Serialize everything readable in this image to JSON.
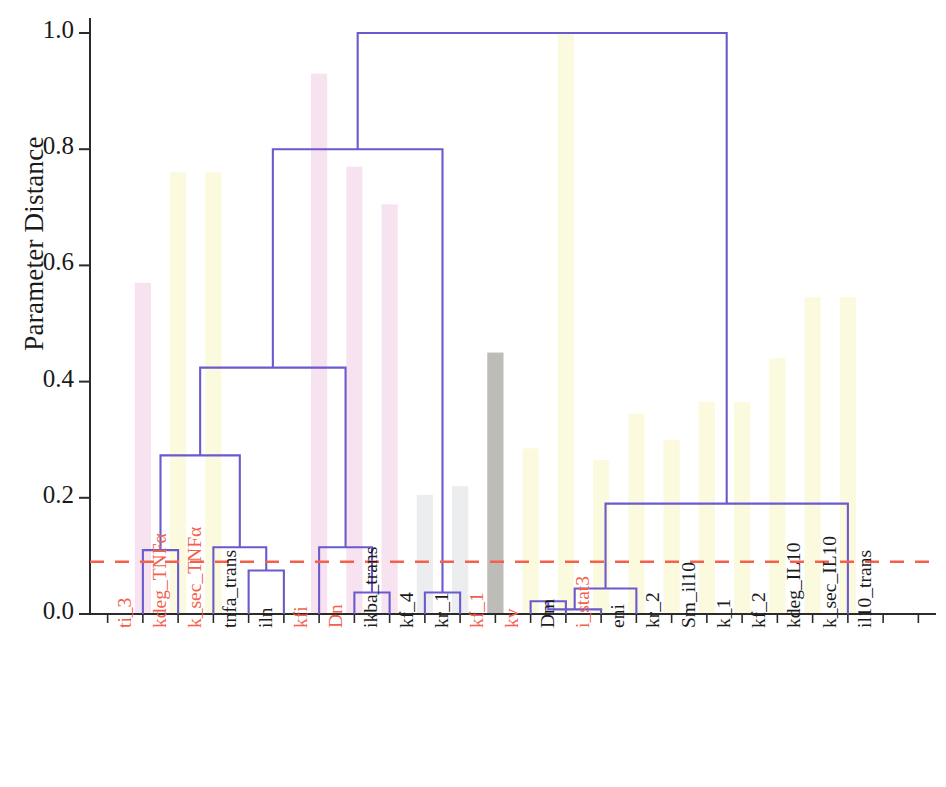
{
  "figure": {
    "type": "dendrogram",
    "ylabel": "Parameter Distance",
    "y_ticks": [
      "1.0",
      "0.8",
      "0.6",
      "0.4",
      "0.2",
      "0.0"
    ],
    "threshold_color": "#f4604b",
    "link_color": "#6a5acd",
    "axis_color": "#2b2b2b"
  },
  "chart_data": {
    "type": "dendrogram",
    "title": "",
    "xlabel": "",
    "ylabel": "Parameter Distance",
    "ylim": [
      0.0,
      1.05
    ],
    "yticks": [
      0.0,
      0.2,
      0.4,
      0.6,
      0.8,
      1.0
    ],
    "grid": false,
    "legend": "none",
    "color_threshold": 0.09,
    "leaf_count": 24,
    "leaves": [
      {
        "index": 0,
        "label": "ti_3",
        "color": "red",
        "bar": "pink",
        "bar_height": 0.0
      },
      {
        "index": 1,
        "label": "kdeg_TNFα",
        "color": "red",
        "bar": "pink",
        "bar_height": 0.57
      },
      {
        "index": 2,
        "label": "k_sec_TNFα",
        "color": "red",
        "bar": "yellow",
        "bar_height": 0.76
      },
      {
        "index": 3,
        "label": "tnfa_trans",
        "color": "black",
        "bar": "yellow",
        "bar_height": 0.76
      },
      {
        "index": 4,
        "label": "iln",
        "color": "black",
        "bar": "none",
        "bar_height": 0.0
      },
      {
        "index": 5,
        "label": "kfi",
        "color": "red",
        "bar": "none",
        "bar_height": 0.0
      },
      {
        "index": 6,
        "label": "Dn",
        "color": "red",
        "bar": "pink",
        "bar_height": 0.93
      },
      {
        "index": 7,
        "label": "ikba_trans",
        "color": "black",
        "bar": "pink",
        "bar_height": 0.77
      },
      {
        "index": 8,
        "label": "kf_4",
        "color": "black",
        "bar": "pink",
        "bar_height": 0.705
      },
      {
        "index": 9,
        "label": "kr_1",
        "color": "black",
        "bar": "gray",
        "bar_height": 0.205
      },
      {
        "index": 10,
        "label": "kf_1",
        "color": "red",
        "bar": "gray",
        "bar_height": 0.22
      },
      {
        "index": 11,
        "label": "kv",
        "color": "red",
        "bar": "darkgray",
        "bar_height": 0.45
      },
      {
        "index": 12,
        "label": "Dm",
        "color": "black",
        "bar": "yellow",
        "bar_height": 0.285
      },
      {
        "index": 13,
        "label": "i_stat3",
        "color": "red",
        "bar": "yellow",
        "bar_height": 1.0
      },
      {
        "index": 14,
        "label": "eni",
        "color": "black",
        "bar": "yellow",
        "bar_height": 0.265
      },
      {
        "index": 15,
        "label": "kr_2",
        "color": "black",
        "bar": "yellow",
        "bar_height": 0.345
      },
      {
        "index": 16,
        "label": "Sm_il10",
        "color": "black",
        "bar": "yellow",
        "bar_height": 0.3
      },
      {
        "index": 17,
        "label": "k_1",
        "color": "black",
        "bar": "yellow",
        "bar_height": 0.365
      },
      {
        "index": 18,
        "label": "kf_2",
        "color": "black",
        "bar": "yellow",
        "bar_height": 0.365
      },
      {
        "index": 19,
        "label": "kdeg_IL10",
        "color": "black",
        "bar": "yellow",
        "bar_height": 0.44
      },
      {
        "index": 20,
        "label": "k_sec_IL10",
        "color": "black",
        "bar": "yellow",
        "bar_height": 0.545
      },
      {
        "index": 21,
        "label": "il10_trans",
        "color": "black",
        "bar": "yellow",
        "bar_height": 0.545
      },
      {
        "index": 22,
        "label": "",
        "color": "black",
        "bar": "none",
        "bar_height": 0.0
      },
      {
        "index": 23,
        "label": "",
        "color": "black",
        "bar": "none",
        "bar_height": 0.0
      }
    ],
    "merges": [
      {
        "id": "m1",
        "left": {
          "leaf": 1
        },
        "right": {
          "leaf": 2
        },
        "height": 0.11
      },
      {
        "id": "m2",
        "left": {
          "leaf": 4
        },
        "right": {
          "leaf": 5
        },
        "height": 0.075
      },
      {
        "id": "m3",
        "left": {
          "node": "m2"
        },
        "right": {
          "leaf": 3
        },
        "height": 0.115
      },
      {
        "id": "m4",
        "left": {
          "node": "m1"
        },
        "right": {
          "node": "m3"
        },
        "height": 0.273
      },
      {
        "id": "m5",
        "left": {
          "leaf": 7
        },
        "right": {
          "leaf": 8
        },
        "height": 0.037
      },
      {
        "id": "m6",
        "left": {
          "leaf": 6
        },
        "right": {
          "node": "m5"
        },
        "height": 0.115
      },
      {
        "id": "m7",
        "left": {
          "node": "m4"
        },
        "right": {
          "node": "m6"
        },
        "height": 0.424
      },
      {
        "id": "m8",
        "left": {
          "leaf": 9
        },
        "right": {
          "leaf": 10
        },
        "height": 0.037
      },
      {
        "id": "m9",
        "left": {
          "node": "m7"
        },
        "right": {
          "node": "m8"
        },
        "height": 0.8
      },
      {
        "id": "m10",
        "left": {
          "leaf": 12
        },
        "right": {
          "leaf": 13
        },
        "height": 0.022
      },
      {
        "id": "m11",
        "left": {
          "node": "m10"
        },
        "right": {
          "leaf": 14
        },
        "height": 0.008
      },
      {
        "id": "m12",
        "left": {
          "node": "m11"
        },
        "right": {
          "leaf": 15
        },
        "height": 0.044
      },
      {
        "id": "m13",
        "left": {
          "node": "m12"
        },
        "right": {
          "leaf": 21
        },
        "height": 0.19
      },
      {
        "id": "m14",
        "left": {
          "node": "m9"
        },
        "right": {
          "node": "m13"
        },
        "height": 1.0
      }
    ]
  }
}
